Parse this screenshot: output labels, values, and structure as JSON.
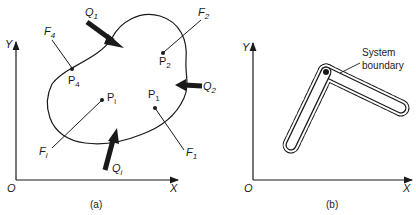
{
  "figure": {
    "panel_a": {
      "caption": "(a)",
      "axes": {
        "y_label": "Y",
        "x_label": "X",
        "origin_label": "O"
      },
      "heat_inputs": [
        {
          "name": "Q",
          "sub": "1"
        },
        {
          "name": "Q",
          "sub": "2"
        },
        {
          "name": "Q",
          "sub": "i"
        }
      ],
      "forces": [
        {
          "name": "F",
          "sub": "1"
        },
        {
          "name": "F",
          "sub": "2"
        },
        {
          "name": "F",
          "sub": "4"
        },
        {
          "name": "F",
          "sub": "i"
        }
      ],
      "points": [
        {
          "name": "P",
          "sub": "1"
        },
        {
          "name": "P",
          "sub": "2"
        },
        {
          "name": "P",
          "sub": "4"
        },
        {
          "name": "P",
          "sub": "i"
        }
      ]
    },
    "panel_b": {
      "caption": "(b)",
      "axes": {
        "y_label": "Y",
        "x_label": "X",
        "origin_label": "O"
      },
      "boundary_label_line1": "System",
      "boundary_label_line2": "boundary"
    }
  }
}
